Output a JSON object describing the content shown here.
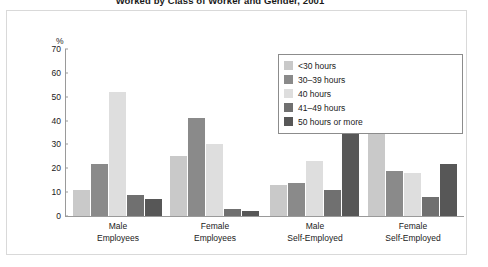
{
  "chart_data": {
    "type": "bar",
    "title": "Worked by Class of Worker and Gender, 2001",
    "xlabel": "",
    "ylabel": "%",
    "ylim": [
      0,
      70
    ],
    "yticks": [
      0,
      10,
      20,
      30,
      40,
      50,
      60,
      70
    ],
    "grid": false,
    "legend_position": "top-right",
    "categories": [
      "Male Employees",
      "Female Employees",
      "Male Self-Employed",
      "Female Self-Employed"
    ],
    "category_lines": [
      [
        "Male",
        "Employees"
      ],
      [
        "Female",
        "Employees"
      ],
      [
        "Male",
        "Self-Employed"
      ],
      [
        "Female",
        "Self-Employed"
      ]
    ],
    "series": [
      {
        "name": "<30 hours",
        "color": "#c9c9c9",
        "values": [
          11,
          25,
          13,
          35
        ]
      },
      {
        "name": "30–39 hours",
        "color": "#8a8a8a",
        "values": [
          22,
          41,
          14,
          19
        ]
      },
      {
        "name": "40 hours",
        "color": "#dedede",
        "values": [
          52,
          30,
          23,
          18
        ]
      },
      {
        "name": "41–49 hours",
        "color": "#707070",
        "values": [
          9,
          3,
          11,
          8
        ]
      },
      {
        "name": "50 hours or more",
        "color": "#575757",
        "values": [
          7,
          2,
          43,
          22
        ]
      }
    ]
  },
  "legend": {
    "left_column": [
      {
        "label": "<30 hours",
        "color": "#c9c9c9"
      },
      {
        "label": "30–39 hours",
        "color": "#8a8a8a"
      },
      {
        "label": "40 hours",
        "color": "#dedede"
      }
    ],
    "right_column": [
      {
        "label": "41–49 hours",
        "color": "#707070"
      },
      {
        "label": "50 hours or more",
        "color": "#575757"
      }
    ]
  }
}
